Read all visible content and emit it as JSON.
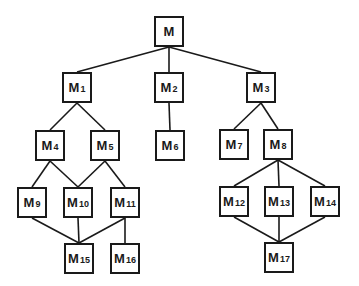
{
  "diagram": {
    "type": "tree",
    "nodes": [
      {
        "id": "M",
        "label": "M",
        "sub": "",
        "x": 154,
        "y": 16
      },
      {
        "id": "M1",
        "label": "M",
        "sub": "1",
        "x": 62,
        "y": 72
      },
      {
        "id": "M2",
        "label": "M",
        "sub": "2",
        "x": 154,
        "y": 72
      },
      {
        "id": "M3",
        "label": "M",
        "sub": "3",
        "x": 246,
        "y": 72
      },
      {
        "id": "M4",
        "label": "M",
        "sub": "4",
        "x": 35,
        "y": 130
      },
      {
        "id": "M5",
        "label": "M",
        "sub": "5",
        "x": 90,
        "y": 130
      },
      {
        "id": "M6",
        "label": "M",
        "sub": "6",
        "x": 155,
        "y": 130
      },
      {
        "id": "M7",
        "label": "M",
        "sub": "7",
        "x": 219,
        "y": 129
      },
      {
        "id": "M8",
        "label": "M",
        "sub": "8",
        "x": 263,
        "y": 129
      },
      {
        "id": "M9",
        "label": "M",
        "sub": "9",
        "x": 17,
        "y": 187
      },
      {
        "id": "M10",
        "label": "M",
        "sub": "10",
        "x": 63,
        "y": 187
      },
      {
        "id": "M11",
        "label": "M",
        "sub": "11",
        "x": 110,
        "y": 187
      },
      {
        "id": "M12",
        "label": "M",
        "sub": "12",
        "x": 219,
        "y": 186
      },
      {
        "id": "M13",
        "label": "M",
        "sub": "13",
        "x": 264,
        "y": 186
      },
      {
        "id": "M14",
        "label": "M",
        "sub": "14",
        "x": 310,
        "y": 186
      },
      {
        "id": "M15",
        "label": "M",
        "sub": "15",
        "x": 64,
        "y": 243
      },
      {
        "id": "M16",
        "label": "M",
        "sub": "16",
        "x": 110,
        "y": 243
      },
      {
        "id": "M17",
        "label": "M",
        "sub": "17",
        "x": 264,
        "y": 242
      }
    ],
    "edges": [
      [
        "M",
        "M1"
      ],
      [
        "M",
        "M2"
      ],
      [
        "M",
        "M3"
      ],
      [
        "M1",
        "M4"
      ],
      [
        "M1",
        "M5"
      ],
      [
        "M2",
        "M6"
      ],
      [
        "M3",
        "M7"
      ],
      [
        "M3",
        "M8"
      ],
      [
        "M4",
        "M9"
      ],
      [
        "M4",
        "M10"
      ],
      [
        "M5",
        "M10"
      ],
      [
        "M5",
        "M11"
      ],
      [
        "M8",
        "M12"
      ],
      [
        "M8",
        "M13"
      ],
      [
        "M8",
        "M14"
      ],
      [
        "M9",
        "M15"
      ],
      [
        "M10",
        "M15"
      ],
      [
        "M11",
        "M15"
      ],
      [
        "M11",
        "M16"
      ],
      [
        "M12",
        "M17"
      ],
      [
        "M13",
        "M17"
      ],
      [
        "M14",
        "M17"
      ]
    ],
    "colors": {
      "stroke": "#1a1a1a",
      "background": "#ffffff"
    }
  }
}
